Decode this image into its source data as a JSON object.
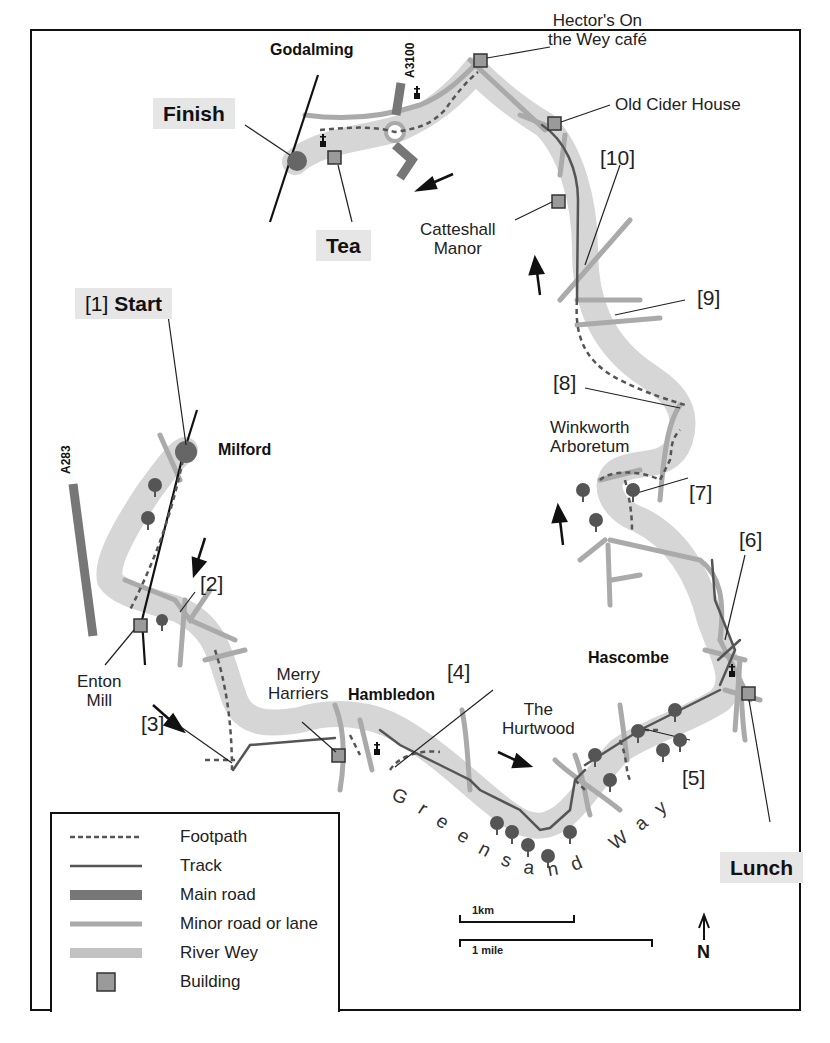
{
  "map": {
    "places": {
      "godalming": "Godalming",
      "milford": "Milford",
      "hambledon": "Hambledon",
      "hascombe": "Hascombe"
    },
    "highlights": {
      "finish": "Finish",
      "tea": "Tea",
      "start_num": "[1]",
      "start": "Start",
      "lunch": "Lunch"
    },
    "features": {
      "hectors_line1": "Hector's On",
      "hectors_line2": "the Wey café",
      "old_cider_house": "Old Cider House",
      "catteshall_line1": "Catteshall",
      "catteshall_line2": "Manor",
      "winkworth_line1": "Winkworth",
      "winkworth_line2": "Arboretum",
      "enton_line1": "Enton",
      "enton_line2": "Mill",
      "merry_line1": "Merry",
      "merry_line2": "Harriers",
      "hurtwood_line1": "The",
      "hurtwood_line2": "Hurtwood",
      "greensand_way": "Greensand Way"
    },
    "roads": {
      "a3100": "A3100",
      "a283": "A283"
    },
    "waypoints": [
      "[2]",
      "[3]",
      "[4]",
      "[5]",
      "[6]",
      "[7]",
      "[8]",
      "[9]",
      "[10]"
    ],
    "colors": {
      "river": "#d4d4d4",
      "minor_road": "#a9a9a9",
      "main_road": "#777777",
      "track": "#555555",
      "footpath": "#555555",
      "building": "#9a9a9a",
      "tree": "#555555",
      "highlight_box": "#e6e6e6"
    }
  },
  "legend": {
    "items": [
      {
        "symbol": "dashed-line",
        "label": "Footpath"
      },
      {
        "symbol": "thin-line",
        "label": "Track"
      },
      {
        "symbol": "thick-dark-line",
        "label": "Main road"
      },
      {
        "symbol": "medium-grey-line",
        "label": "Minor road or lane"
      },
      {
        "symbol": "thick-light-line",
        "label": "River Wey"
      },
      {
        "symbol": "square",
        "label": "Building"
      }
    ]
  },
  "scale": {
    "km": "1km",
    "mile": "1 mile"
  },
  "north": "N"
}
